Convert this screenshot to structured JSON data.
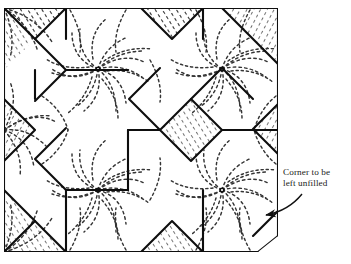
{
  "figure": {
    "kind": "needlework-pattern-diagram",
    "title_fragment": "",
    "background_color": "#ffffff",
    "ink_color": "#1a1a1a",
    "hatch_color": "#2a2a2a",
    "stitch_color": "#3a3a3a"
  },
  "annotation": {
    "name": "corner-note",
    "line1": "Corner to be",
    "line2": "left unfilled",
    "arrow": {
      "type": "curved-arrow",
      "points_to": "bottom-right-corner",
      "start_x": 300,
      "start_y": 196,
      "end_x": 258,
      "end_y": 216
    }
  },
  "geometry": {
    "frame": {
      "left": 4,
      "top": 8,
      "right": 278,
      "bottom": 252
    },
    "cell_width": 68,
    "cell_height": 61,
    "star_centers": [
      {
        "x": 98,
        "y": 69
      },
      {
        "x": 222,
        "y": 69
      },
      {
        "x": 98,
        "y": 190
      },
      {
        "x": 222,
        "y": 190
      }
    ],
    "hatched_cells": [
      {
        "id": "top-left-wedge",
        "x": 4,
        "y": 8
      },
      {
        "id": "top-mid-diamond",
        "x": 141,
        "y": 8
      },
      {
        "id": "top-right-wedge",
        "x": 244,
        "y": 8
      },
      {
        "id": "left-diamond",
        "x": 4,
        "y": 130
      },
      {
        "id": "center-diamond",
        "x": 160,
        "y": 128
      },
      {
        "id": "right-wedge",
        "x": 250,
        "y": 130
      },
      {
        "id": "bottom-left-wedge",
        "x": 4,
        "y": 221
      },
      {
        "id": "bottom-mid-triangle",
        "x": 141,
        "y": 221
      }
    ],
    "unfilled_corner": {
      "x": 278,
      "y": 252
    }
  }
}
